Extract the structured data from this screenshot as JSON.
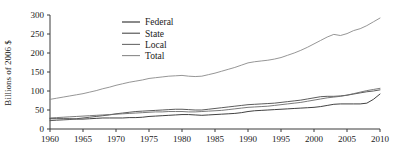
{
  "chart_data": {
    "type": "line",
    "title": "",
    "xlabel": "",
    "ylabel": "Billions of 2006 $",
    "xlim": [
      1960,
      2010
    ],
    "ylim": [
      0,
      300
    ],
    "grid": false,
    "legend_position": "top-center",
    "xticks": [
      1960,
      1965,
      1970,
      1975,
      1980,
      1985,
      1990,
      1995,
      2000,
      2005,
      2010
    ],
    "yticks": [
      0,
      50,
      100,
      150,
      200,
      250,
      300
    ],
    "x": [
      1960,
      1961,
      1962,
      1963,
      1964,
      1965,
      1966,
      1967,
      1968,
      1969,
      1970,
      1971,
      1972,
      1973,
      1974,
      1975,
      1976,
      1977,
      1978,
      1979,
      1980,
      1981,
      1982,
      1983,
      1984,
      1985,
      1986,
      1987,
      1988,
      1989,
      1990,
      1991,
      1992,
      1993,
      1994,
      1995,
      1996,
      1997,
      1998,
      1999,
      2000,
      2001,
      2002,
      2003,
      2004,
      2005,
      2006,
      2007,
      2008,
      2009,
      2010
    ],
    "series": [
      {
        "name": "Federal",
        "color": "#2b2b2b",
        "values": [
          27,
          27,
          27,
          27,
          26,
          26,
          27,
          28,
          29,
          29,
          29,
          29,
          30,
          30,
          31,
          33,
          34,
          35,
          36,
          37,
          38,
          38,
          37,
          36,
          37,
          38,
          39,
          40,
          41,
          43,
          46,
          48,
          49,
          50,
          51,
          52,
          53,
          54,
          55,
          56,
          57,
          59,
          62,
          65,
          66,
          66,
          66,
          66,
          68,
          78,
          92
        ]
      },
      {
        "name": "State",
        "color": "#4a4a4a",
        "values": [
          22,
          23,
          24,
          25,
          27,
          29,
          31,
          33,
          35,
          37,
          40,
          42,
          44,
          46,
          47,
          48,
          49,
          50,
          51,
          52,
          52,
          51,
          50,
          50,
          52,
          54,
          56,
          58,
          60,
          62,
          64,
          65,
          66,
          67,
          68,
          70,
          72,
          74,
          76,
          79,
          82,
          85,
          86,
          86,
          87,
          89,
          92,
          95,
          98,
          100,
          103
        ]
      },
      {
        "name": "Local",
        "color": "#6b6b6b",
        "values": [
          29,
          30,
          31,
          32,
          33,
          34,
          35,
          36,
          37,
          38,
          39,
          40,
          41,
          42,
          43,
          44,
          45,
          45,
          46,
          46,
          46,
          45,
          45,
          46,
          47,
          48,
          49,
          51,
          53,
          55,
          57,
          58,
          59,
          60,
          62,
          64,
          66,
          68,
          70,
          73,
          76,
          79,
          82,
          84,
          86,
          89,
          93,
          97,
          101,
          104,
          107
        ]
      },
      {
        "name": "Total",
        "color": "#8a8a8a",
        "values": [
          78,
          81,
          84,
          87,
          90,
          93,
          97,
          101,
          106,
          110,
          115,
          119,
          123,
          126,
          129,
          133,
          135,
          137,
          139,
          140,
          141,
          139,
          138,
          139,
          143,
          147,
          152,
          157,
          162,
          168,
          174,
          177,
          179,
          181,
          184,
          188,
          194,
          200,
          207,
          215,
          224,
          233,
          242,
          249,
          246,
          251,
          259,
          264,
          272,
          282,
          292
        ]
      }
    ]
  },
  "legend": {
    "items": [
      {
        "label": "Federal"
      },
      {
        "label": "State"
      },
      {
        "label": "Local"
      },
      {
        "label": "Total"
      }
    ]
  }
}
